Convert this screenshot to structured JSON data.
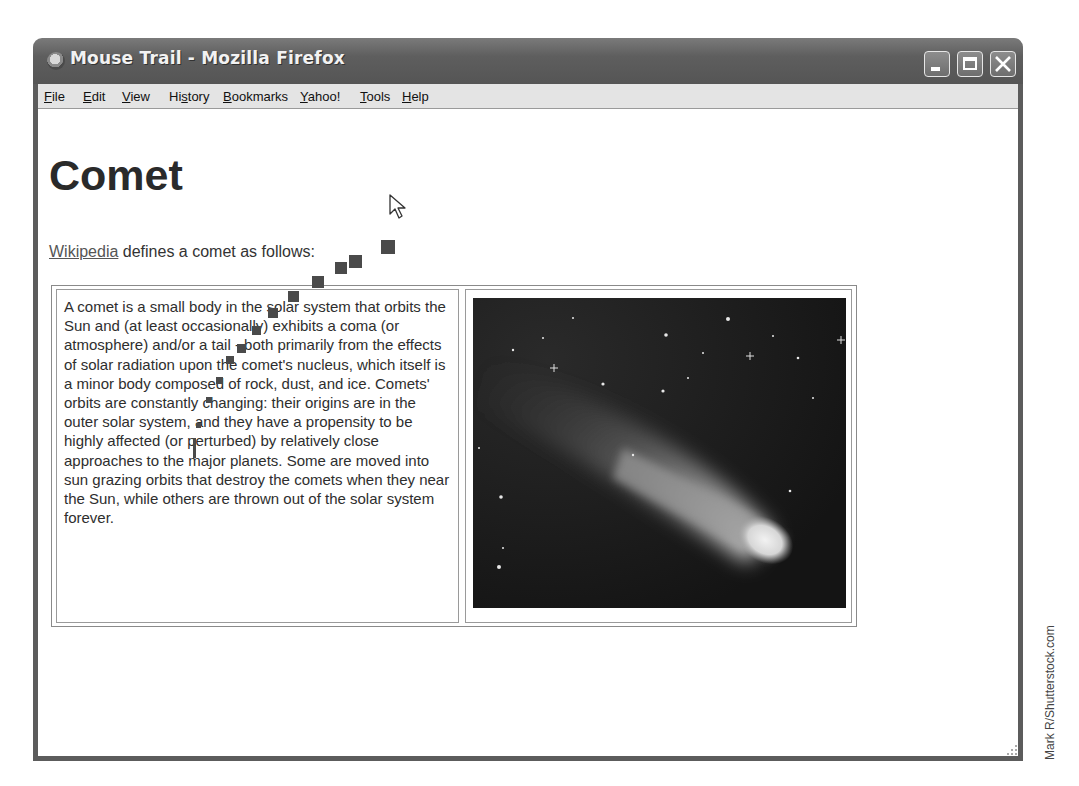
{
  "window": {
    "title": "Mouse Trail - Mozilla Firefox",
    "controls": [
      "minimize",
      "maximize",
      "close"
    ]
  },
  "menubar": {
    "items": [
      {
        "label": "File",
        "accel": "F"
      },
      {
        "label": "Edit",
        "accel": "E"
      },
      {
        "label": "View",
        "accel": "V"
      },
      {
        "label": "History",
        "accel": "s"
      },
      {
        "label": "Bookmarks",
        "accel": "B"
      },
      {
        "label": "Yahoo!",
        "accel": "Y"
      },
      {
        "label": "Tools",
        "accel": "T"
      },
      {
        "label": "Help",
        "accel": "H"
      }
    ]
  },
  "page": {
    "heading": "Comet",
    "intro_link": "Wikipedia",
    "intro_text": " defines a comet as follows:",
    "definition": "A comet is a small body in the solar system that orbits the Sun and (at least occasionally) exhibits a coma (or atmosphere) and/or a tail - both primarily from the effects of solar radiation upon the comet's nucleus, which itself is a minor body composed of rock, dust, and ice. Comets' orbits are constantly changing: their origins are in the outer solar system, and they have a propensity to be highly affected (or perturbed) by relatively close approaches to the major planets. Some are moved into sun grazing orbits that destroy the comets when they near the Sun, while others are thrown out of the solar system forever.",
    "image_alt": "comet-photo"
  },
  "trail": [
    {
      "x": 381,
      "y": 240,
      "s": 14
    },
    {
      "x": 349,
      "y": 255,
      "s": 13
    },
    {
      "x": 335,
      "y": 262,
      "s": 12
    },
    {
      "x": 312,
      "y": 276,
      "s": 12
    },
    {
      "x": 288,
      "y": 291,
      "s": 11
    },
    {
      "x": 268,
      "y": 308,
      "s": 10
    },
    {
      "x": 252,
      "y": 326,
      "s": 9
    },
    {
      "x": 237,
      "y": 344,
      "s": 9
    },
    {
      "x": 226,
      "y": 356,
      "s": 8
    },
    {
      "x": 216,
      "y": 377,
      "s": 7
    },
    {
      "x": 206,
      "y": 397,
      "s": 6
    },
    {
      "x": 196,
      "y": 423,
      "s": 5
    },
    {
      "x": 193,
      "y": 438,
      "s": 3,
      "h": 20
    }
  ],
  "credit": "Mark R/Shutterstock.com"
}
